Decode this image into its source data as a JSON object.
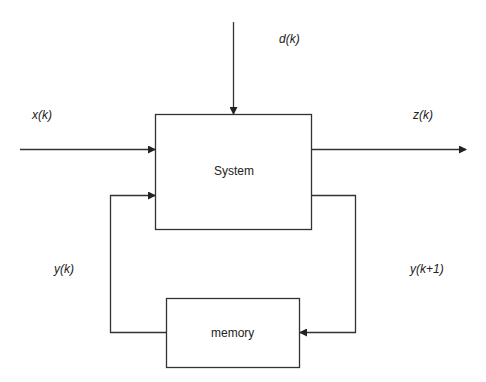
{
  "diagram": {
    "blocks": {
      "system": "System",
      "memory": "memory"
    },
    "signals": {
      "input": "x(k)",
      "disturbance": "d(k)",
      "output": "z(k)",
      "state": "y(k)",
      "next_state": "y(k+1)"
    },
    "colors": {
      "line": "#333333",
      "background": "#ffffff"
    }
  }
}
